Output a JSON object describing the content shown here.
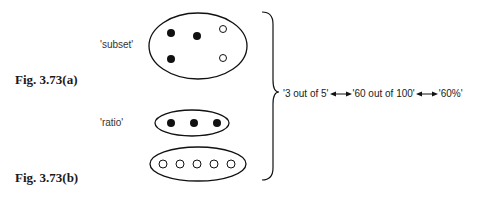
{
  "figures": {
    "a": {
      "label": "Fig. 3.73(a)",
      "caption": "'subset'"
    },
    "b": {
      "label": "Fig. 3.73(b)",
      "caption": "'ratio'"
    }
  },
  "equivalences": {
    "items": [
      "'3 out of 5'",
      "'60 out of 100'",
      "'60%'"
    ]
  },
  "sets": {
    "subset_ellipse": {
      "filled": 3,
      "hollow": 2
    },
    "ratio_top_ellipse": {
      "filled": 3,
      "hollow": 0
    },
    "ratio_bottom_ellipse": {
      "filled": 0,
      "hollow": 5
    }
  },
  "colors": {
    "ink": "#111111",
    "background": "#ffffff"
  }
}
